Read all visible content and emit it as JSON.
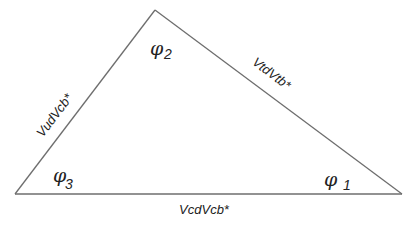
{
  "diagram": {
    "type": "unitarity-triangle",
    "vertices": {
      "top": {
        "x": 155,
        "y": 10
      },
      "left": {
        "x": 15,
        "y": 194
      },
      "right": {
        "x": 402,
        "y": 194
      }
    },
    "edge_color": "#6e6e6e",
    "text_color": "#222222",
    "sides": {
      "left": "VudVcb*",
      "right": "VtdVtb*",
      "bottom": "VcdVcb*"
    },
    "angles": {
      "phi1": {
        "symbol": "φ",
        "subscript": "1"
      },
      "phi2": {
        "symbol": "φ",
        "subscript": "2"
      },
      "phi3": {
        "symbol": "φ",
        "subscript": "3"
      }
    }
  }
}
